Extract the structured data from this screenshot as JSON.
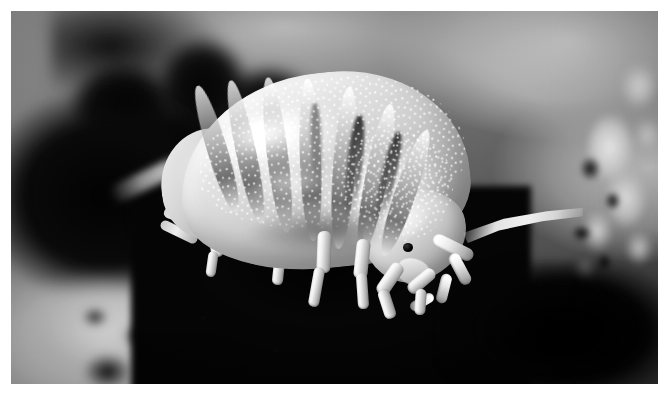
{
  "image": {
    "type": "natural-image",
    "subject": "woodlouse",
    "subject_common_names": [
      "woodlouse",
      "pill bug",
      "sow bug",
      "roly-poly"
    ],
    "scene": "macro photograph of a woodlouse crawling over dark soil and leaf litter",
    "treatment": "black and white",
    "orientation": "landscape",
    "canvas": {
      "width": 669,
      "height": 398
    },
    "plate": {
      "left": 11,
      "top": 11,
      "width": 647,
      "height": 373
    },
    "border": {
      "style": "thin white page margin",
      "color": "#ffffff",
      "thickness_px": 11
    }
  },
  "palette": {
    "page": "#ffffff",
    "background_light": "#c9c9c9",
    "background_mid": "#8a8a8a",
    "background_dark": "#3c3c3c",
    "substrate_black": "#0a0a0a",
    "body_highlight": "#ffffff",
    "body_midtone": "#cacaca",
    "body_shadow": "#8d8d8d",
    "segment_band": "#232323",
    "eye": "#000000"
  },
  "subject": {
    "label": "woodlouse",
    "pose": "side profile, head to the lower right, body arched",
    "body_parts": [
      {
        "name": "pereon",
        "label": "segmented thorax",
        "description": "seven overlapping arched tergite segments"
      },
      {
        "name": "pleon",
        "label": "rear abdomen",
        "description": "tapered posterior at the left"
      },
      {
        "name": "cephalon",
        "label": "head",
        "description": "rounded head at the lower right"
      },
      {
        "name": "eye",
        "label": "compound eye",
        "description": "small dark spot on the side of the head"
      },
      {
        "name": "antenna",
        "label": "antenna",
        "description": "jointed flagellum curving down and right from the head"
      },
      {
        "name": "pereopods",
        "label": "walking legs",
        "description": "pale jointed legs planted on the dark substrate"
      },
      {
        "name": "uropods",
        "label": "rear appendages",
        "description": "paired tail appendages at the left"
      },
      {
        "name": "tubercles",
        "label": "cuticle tubercles",
        "description": "dense bright granular bumps covering the back"
      }
    ],
    "segment_count": 7,
    "texture": "granulated, tuberculate cuticle with bright specular highlights"
  },
  "background": {
    "elements": [
      {
        "name": "soil-substrate",
        "label": "dark soil and leaf litter",
        "focus": "near-focus",
        "tone": "near-black"
      },
      {
        "name": "debris-cluster-right",
        "label": "bright organic debris",
        "focus": "out-of-focus",
        "tone": "light gray"
      },
      {
        "name": "foreground-blur-left",
        "label": "bright blurred foreground",
        "focus": "out-of-focus",
        "tone": "light gray"
      },
      {
        "name": "gradient-field",
        "label": "soft gray gradient backdrop",
        "focus": "out-of-focus",
        "tone": "mid gray"
      }
    ]
  }
}
